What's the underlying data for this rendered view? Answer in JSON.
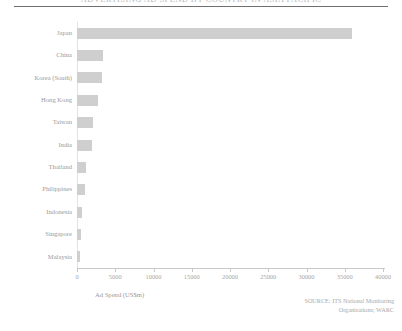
{
  "chart_data": {
    "type": "bar",
    "orientation": "horizontal",
    "title": "ADVERTISING AD SPEND BY COUNTRY IN ASIA PACIFIC",
    "xlabel": "Ad Spend (US$m)",
    "ylabel": "",
    "categories": [
      "Japan",
      "China",
      "Korea (South)",
      "Hong Kong",
      "Taiwan",
      "India",
      "Thailand",
      "Philippines",
      "Indonesia",
      "Singapore",
      "Malaysia"
    ],
    "values": [
      36000,
      3400,
      3300,
      2700,
      2100,
      1900,
      1200,
      1000,
      700,
      500,
      450
    ],
    "xlim": [
      0,
      40000
    ],
    "xticks": [
      0,
      5000,
      10000,
      15000,
      20000,
      25000,
      30000,
      35000,
      40000
    ],
    "xticklabels": [
      "0",
      "5000",
      "10000",
      "15000",
      "20000",
      "25000",
      "30000",
      "35000",
      "40000"
    ],
    "grid": false,
    "legend": null,
    "bar_color": "#cfcfcf",
    "source": [
      "SOURCE: ITS National Monitoring",
      "Organisations; WARC"
    ]
  }
}
